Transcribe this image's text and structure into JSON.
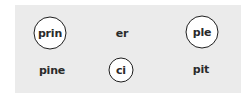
{
  "syllables": [
    {
      "text": "prin",
      "row": 1,
      "col": 1,
      "circled": true
    },
    {
      "text": "er",
      "row": 1,
      "col": 2,
      "circled": false
    },
    {
      "text": "ple",
      "row": 1,
      "col": 3,
      "circled": true
    },
    {
      "text": "pine",
      "row": 2,
      "col": 1,
      "circled": false
    },
    {
      "text": "ci",
      "row": 2,
      "col": 2,
      "circled": true
    },
    {
      "text": "pit",
      "row": 2,
      "col": 3,
      "circled": false
    }
  ],
  "colors": {
    "panel_background": "#ebebeb",
    "circle_border": "#1e1e1e",
    "text": "#2a2a2a"
  }
}
